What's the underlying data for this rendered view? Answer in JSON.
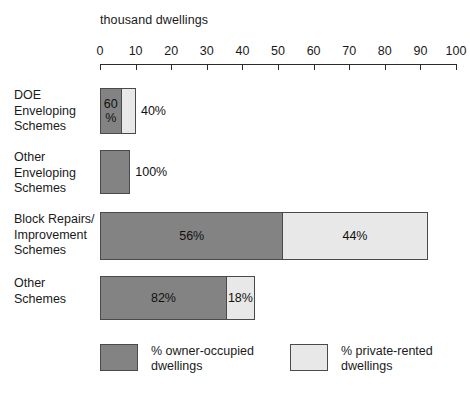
{
  "chart_data": {
    "type": "bar",
    "orientation": "horizontal",
    "stacked": true,
    "stacked_mode": "percentage-of-row-total",
    "title": "",
    "xlabel": "thousand dwellings",
    "ylabel": "",
    "xlim": [
      0,
      100
    ],
    "xticks": [
      0,
      10,
      20,
      30,
      40,
      50,
      60,
      70,
      80,
      90,
      100
    ],
    "xtick_labels": [
      "0",
      "10",
      "20",
      "30",
      "40",
      "50",
      "60",
      "70",
      "80",
      "90",
      "100"
    ],
    "grid": false,
    "legend_position": "bottom",
    "categories": [
      "DOE Enveloping Schemes",
      "Other Enveloping Schemes",
      "Block Repairs/ Improvement Schemes",
      "Other Schemes"
    ],
    "series": [
      {
        "name": "% owner-occupied dwellings",
        "color": "#838383",
        "values": [
          60,
          100,
          56,
          82
        ]
      },
      {
        "name": "% private-rented dwellings",
        "color": "#e8e8e8",
        "values": [
          40,
          0,
          44,
          18
        ]
      }
    ],
    "row_totals_thousand_dwellings": [
      10.1,
      8.5,
      92.0,
      43.5
    ],
    "rows": [
      {
        "label": "DOE\nEnveloping\nSchemes",
        "total": 10.1,
        "segments": [
          {
            "series": "% owner-occupied dwellings",
            "percent": 60,
            "value_label": "60\n%",
            "label_inside": true
          },
          {
            "series": "% private-rented dwellings",
            "percent": 40,
            "value_label": "40%",
            "label_inside": false
          }
        ]
      },
      {
        "label": "Other\nEnveloping\nSchemes",
        "total": 8.5,
        "segments": [
          {
            "series": "% owner-occupied dwellings",
            "percent": 100,
            "value_label": "100%",
            "label_inside": false
          }
        ]
      },
      {
        "label": "Block Repairs/\nImprovement\nSchemes",
        "total": 92.0,
        "segments": [
          {
            "series": "% owner-occupied dwellings",
            "percent": 56,
            "value_label": "56%",
            "label_inside": true
          },
          {
            "series": "% private-rented dwellings",
            "percent": 44,
            "value_label": "44%",
            "label_inside": true
          }
        ]
      },
      {
        "label": "Other\nSchemes",
        "total": 43.5,
        "segments": [
          {
            "series": "% owner-occupied dwellings",
            "percent": 82,
            "value_label": "82%",
            "label_inside": true
          },
          {
            "series": "% private-rented dwellings",
            "percent": 18,
            "value_label": "18%",
            "label_inside": true
          }
        ]
      }
    ],
    "legend": [
      {
        "label": "% owner-occupied\ndwellings",
        "color": "#838383"
      },
      {
        "label": "% private-rented\ndwellings",
        "color": "#e8e8e8"
      }
    ]
  },
  "colors": {
    "owner_occupied": "#838383",
    "private_rented": "#e8e8e8",
    "outline": "#4a4a4a",
    "axis": "#2b2b2b",
    "text": "#1a1a1a",
    "background": "#ffffff"
  }
}
